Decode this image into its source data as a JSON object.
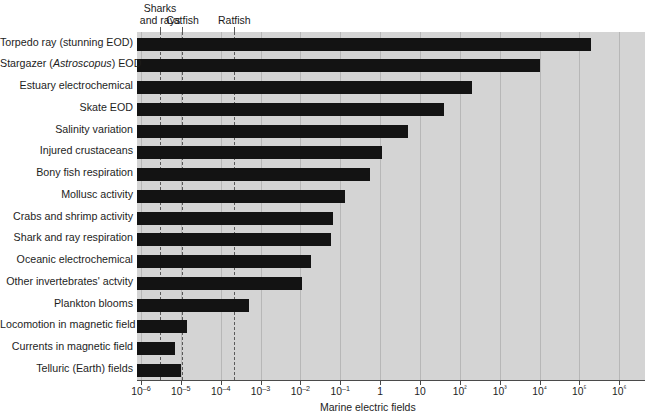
{
  "chart_data": {
    "type": "bar",
    "orientation": "horizontal",
    "title": "",
    "xlabel": "Marine electric fields",
    "ylabel": "",
    "xscale": "log",
    "xlim": [
      1e-06,
      1000000.0
    ],
    "grid": false,
    "legend": null,
    "xtick_labels": [
      "10–6",
      "10–5",
      "10–4",
      "10–3",
      "10–2",
      "10–1",
      "1",
      "10",
      "10²",
      "10³",
      "10⁴",
      "10⁵",
      "10⁶"
    ],
    "xtick_values": [
      1e-06,
      1e-05,
      0.0001,
      0.001,
      0.01,
      0.1,
      1,
      10,
      100,
      1000,
      10000,
      100000,
      1000000
    ],
    "categories": [
      "Torpedo ray (stunning EOD)",
      "Stargazer (Astroscopus) EOD",
      "Estuary electrochemical",
      "Skate EOD",
      "Salinity variation",
      "Injured crustaceans",
      "Bony fish respiration",
      "Mollusc activity",
      "Crabs and shrimp activity",
      "Shark and ray respiration",
      "Oceanic electrochemical",
      "Other invertebrates' actvity",
      "Plankton blooms",
      "Locomotion in magnetic field",
      "Currents in magnetic field",
      "Telluric (Earth) fields"
    ],
    "values": [
      200000.0,
      10000.0,
      200.0,
      40.0,
      5,
      1.1,
      0.55,
      0.13,
      0.065,
      0.06,
      0.018,
      0.011,
      0.0005,
      1.4e-05,
      7e-06,
      1e-05
    ],
    "annotations": [
      {
        "label": "Sharks\nand rays",
        "label_line1": "Sharks",
        "label_line2": "and rays",
        "value": 3e-06,
        "style": "dashed"
      },
      {
        "label": "Catfish",
        "label_line1": "Catfish",
        "label_line2": "",
        "value": 1.1e-05,
        "style": "dashed"
      },
      {
        "label": "Ratfish",
        "label_line1": "Ratfish",
        "label_line2": "",
        "value": 0.00022,
        "style": "dashed"
      }
    ],
    "colors": {
      "bar": "#131313",
      "plot_background": "#d4d4d4",
      "page_background": "#ffffff",
      "annotation_line": "#5a5a5a",
      "axis": "#4a4a4a",
      "text": "#1d1d1d"
    }
  },
  "rows": [
    {
      "label": "Torpedo ray (stunning EOD)",
      "value": 200000.0
    },
    {
      "label": "Stargazer (Astroscopus) EOD",
      "value": 10000.0,
      "italic_part": "Astroscopus"
    },
    {
      "label": "Estuary electrochemical",
      "value": 200.0
    },
    {
      "label": "Skate EOD",
      "value": 40.0
    },
    {
      "label": "Salinity variation",
      "value": 5
    },
    {
      "label": "Injured crustaceans",
      "value": 1.1
    },
    {
      "label": "Bony fish respiration",
      "value": 0.55
    },
    {
      "label": "Mollusc activity",
      "value": 0.13
    },
    {
      "label": "Crabs and shrimp activity",
      "value": 0.065
    },
    {
      "label": "Shark and ray respiration",
      "value": 0.06
    },
    {
      "label": "Oceanic electrochemical",
      "value": 0.018
    },
    {
      "label": "Other invertebrates' actvity",
      "value": 0.011
    },
    {
      "label": "Plankton blooms",
      "value": 0.0005
    },
    {
      "label": "Locomotion in magnetic field",
      "value": 1.4e-05
    },
    {
      "label": "Currents in magnetic field",
      "value": 7e-06
    },
    {
      "label": "Telluric (Earth) fields",
      "value": 1e-05
    }
  ]
}
